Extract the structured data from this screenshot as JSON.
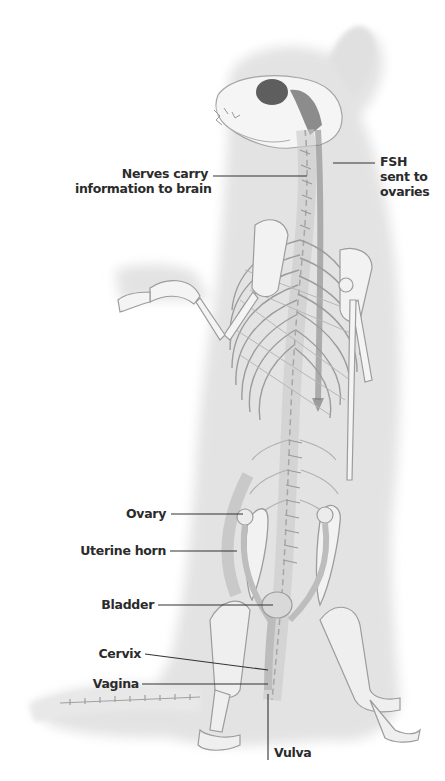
{
  "diagram": {
    "colors": {
      "background": "#ffffff",
      "body_shade": "#e6e6e6",
      "bone": "#f4f4f4",
      "bone_outline": "#9a9a9a",
      "dark_shade": "#6e6e6e",
      "leader_line": "#333333",
      "label_text": "#2b2b2b"
    },
    "labels": {
      "nerves": {
        "line1": "Nerves carry",
        "line2": "information to brain"
      },
      "fsh": {
        "line1": "FSH",
        "line2": "sent to",
        "line3": "ovaries"
      },
      "ovary": "Ovary",
      "uterine_horn": "Uterine horn",
      "bladder": "Bladder",
      "cervix": "Cervix",
      "vagina": "Vagina",
      "vulva": "Vulva"
    }
  }
}
